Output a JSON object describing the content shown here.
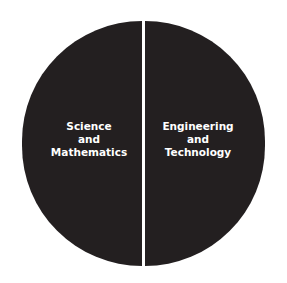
{
  "diagram": {
    "type": "split-circle",
    "segments": [
      {
        "lines": [
          "Science",
          "and",
          "Mathematics"
        ]
      },
      {
        "lines": [
          "Engineering",
          "and",
          "Technology"
        ]
      }
    ],
    "colors": {
      "fill": "#231f20",
      "text": "#ffffff",
      "divider": "#ffffff",
      "background": "#ffffff"
    }
  }
}
